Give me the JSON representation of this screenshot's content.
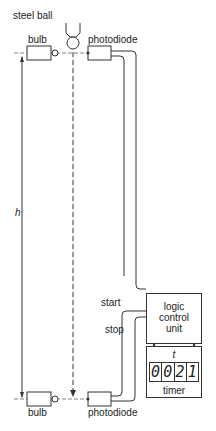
{
  "labels": {
    "steel_ball": "steel ball",
    "bulb_top": "bulb",
    "photodiode_top": "photodiode",
    "height": "h",
    "start": "start",
    "stop": "stop",
    "bulb_bottom": "bulb",
    "photodiode_bottom": "photodiode"
  },
  "logic_unit": {
    "line1": "logic",
    "line2": "control",
    "line3": "unit"
  },
  "timer": {
    "symbol": "t",
    "digits": [
      "0",
      "0",
      "2",
      "1"
    ],
    "label": "timer"
  }
}
